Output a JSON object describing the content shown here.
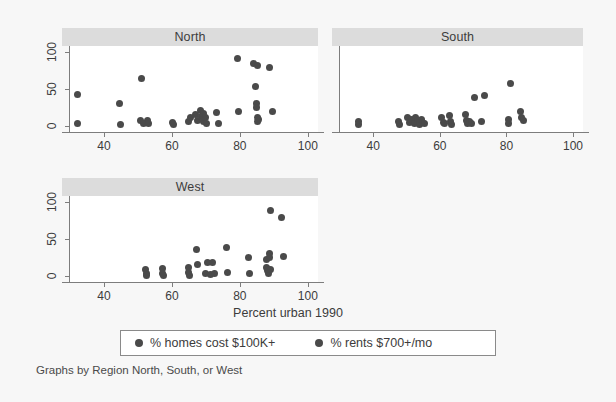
{
  "chart_data": {
    "type": "scatter",
    "title": "",
    "xlabel": "Percent urban 1990",
    "ylabel": "",
    "caption": "Graphs by Region North, South, or West",
    "xlim": [
      30,
      103
    ],
    "ylim": [
      -8,
      108
    ],
    "xticks": [
      40,
      60,
      80,
      100
    ],
    "yticks": [
      0,
      50,
      100
    ],
    "grid": false,
    "legend_position": "bottom",
    "facet_var": "Region",
    "legend": [
      {
        "label": "% homes cost $100K+",
        "color": "#4a4a4a",
        "marker": "circle"
      },
      {
        "label": "% rents $700+/mo",
        "color": "#4a4a4a",
        "marker": "circle"
      }
    ],
    "panels": [
      {
        "name": "North",
        "series": [
          {
            "name": "% homes cost $100K+",
            "points": [
              [
                32.2,
                43
              ],
              [
                32.2,
                3
              ],
              [
                44.6,
                31
              ],
              [
                45.0,
                2
              ],
              [
                50.9,
                64
              ],
              [
                50.8,
                7
              ],
              [
                51.5,
                3
              ],
              [
                52.8,
                8
              ],
              [
                53.2,
                3
              ],
              [
                60.3,
                5
              ],
              [
                60.6,
                2
              ],
              [
                64.9,
                6
              ],
              [
                65.6,
                11
              ],
              [
                66.9,
                15
              ],
              [
                67.4,
                7
              ],
              [
                68.3,
                21
              ],
              [
                68.6,
                13
              ],
              [
                69.2,
                17
              ],
              [
                69.4,
                6
              ],
              [
                69.8,
                11
              ],
              [
                70.1,
                4
              ],
              [
                73.2,
                18
              ],
              [
                73.6,
                3
              ],
              [
                79.2,
                91
              ],
              [
                79.5,
                19
              ],
              [
                84.1,
                84
              ],
              [
                84.6,
                53
              ],
              [
                84.8,
                30
              ],
              [
                85.0,
                25
              ],
              [
                85.3,
                82
              ],
              [
                85.1,
                11
              ],
              [
                85.2,
                6
              ],
              [
                85.4,
                9
              ],
              [
                88.6,
                79
              ],
              [
                89.6,
                20
              ]
            ]
          }
        ]
      },
      {
        "name": "South",
        "series": [
          {
            "name": "% rents $700+/mo",
            "points": [
              [
                35.6,
                6
              ],
              [
                35.7,
                2
              ],
              [
                47.6,
                6
              ],
              [
                47.8,
                2
              ],
              [
                50.4,
                12
              ],
              [
                51.0,
                5
              ],
              [
                51.6,
                9
              ],
              [
                52.3,
                3
              ],
              [
                52.8,
                11
              ],
              [
                53.4,
                6
              ],
              [
                53.9,
                2
              ],
              [
                54.4,
                9
              ],
              [
                54.9,
                5
              ],
              [
                55.3,
                3
              ],
              [
                60.6,
                12
              ],
              [
                61.0,
                5
              ],
              [
                61.5,
                3
              ],
              [
                62.8,
                14
              ],
              [
                63.3,
                6
              ],
              [
                63.6,
                2
              ],
              [
                67.6,
                15
              ],
              [
                68.0,
                8
              ],
              [
                68.3,
                4
              ],
              [
                68.8,
                6
              ],
              [
                69.4,
                3
              ],
              [
                70.4,
                38
              ],
              [
                72.6,
                6
              ],
              [
                73.4,
                41
              ],
              [
                80.6,
                9
              ],
              [
                80.7,
                3
              ],
              [
                81.3,
                57
              ],
              [
                84.2,
                20
              ],
              [
                84.5,
                12
              ],
              [
                85.0,
                7
              ]
            ]
          }
        ]
      },
      {
        "name": "West",
        "series": [
          {
            "name": "% homes cost $100K+",
            "points": [
              [
                52.3,
                9
              ],
              [
                52.4,
                3
              ],
              [
                52.6,
                1
              ],
              [
                57.2,
                10
              ],
              [
                57.3,
                4
              ],
              [
                57.4,
                1
              ],
              [
                64.8,
                11
              ],
              [
                64.9,
                5
              ],
              [
                65.1,
                1
              ],
              [
                67.2,
                36
              ],
              [
                67.5,
                16
              ],
              [
                69.8,
                3
              ],
              [
                70.6,
                18
              ],
              [
                71.3,
                2
              ],
              [
                71.9,
                18
              ],
              [
                72.4,
                3
              ],
              [
                76.0,
                39
              ],
              [
                76.3,
                5
              ],
              [
                82.6,
                25
              ],
              [
                82.8,
                4
              ],
              [
                87.7,
                22
              ],
              [
                87.9,
                12
              ],
              [
                88.2,
                7
              ],
              [
                88.4,
                3
              ],
              [
                88.6,
                30
              ],
              [
                88.8,
                25
              ],
              [
                88.9,
                88
              ],
              [
                89.1,
                9
              ],
              [
                92.4,
                79
              ],
              [
                92.9,
                26
              ]
            ]
          }
        ]
      }
    ]
  }
}
